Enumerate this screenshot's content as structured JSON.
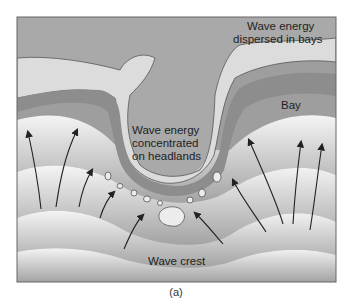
{
  "figure": {
    "panel_label": "(a)",
    "labels": {
      "dispersed": [
        "Wave energy",
        "dispersed in bays"
      ],
      "concentrated": [
        "Wave energy",
        "concentrated",
        "on headlands"
      ],
      "bay": "Bay",
      "wave_crest": "Wave crest"
    },
    "colors": {
      "land": "#a8a8a8",
      "cliff": "#dedede",
      "beach": "#8f8f8f",
      "water_dark": "#9a9a9a",
      "water_light": "#f2f2f2",
      "arrow": "#222222",
      "frame": "#666666"
    }
  }
}
